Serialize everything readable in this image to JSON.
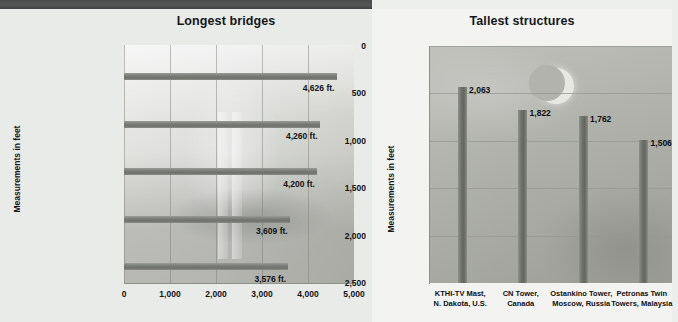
{
  "header": {
    "rule": "dark-rule"
  },
  "left": {
    "title": "Longest bridges",
    "axis_title": "Measurements in feet",
    "x_ticks": [
      "0",
      "1,000",
      "2,000",
      "3,000",
      "4,000",
      "5,000"
    ],
    "categories": [
      "Humber Estuary,|England",
      "Verrazano Narrows,|Brooklyn, NY, U.S.",
      "Golden Gate,|San Francisco, CA, U.S.",
      "Minami Bisan-Seto,|Japan",
      "Bosporus I,|Istanbul, Turkey"
    ],
    "value_labels": [
      "4,626 ft.",
      "4,260 ft.",
      "4,200 ft.",
      "3,609 ft.",
      "3,576 ft."
    ]
  },
  "right": {
    "title": "Tallest structures",
    "axis_title": "Measurements in feet",
    "y_ticks": [
      "2,500",
      "2,000",
      "1,500",
      "1,000",
      "500",
      "0"
    ],
    "categories": [
      "KTHI-TV Mast,|N. Dakota, U.S.",
      "CN Tower,|Canada",
      "Ostankino Tower,|Moscow, Russia",
      "Petronas Twin|Towers, Malaysia"
    ],
    "value_labels": [
      "2,063",
      "1,822",
      "1,762",
      "1,506"
    ]
  },
  "chart_data": [
    {
      "type": "bar",
      "orientation": "horizontal",
      "title": "Longest bridges",
      "xlabel": "",
      "ylabel": "Measurements in feet",
      "categories": [
        "Humber Estuary, England",
        "Verrazano Narrows, Brooklyn, NY, U.S.",
        "Golden Gate, San Francisco, CA, U.S.",
        "Minami Bisan-Seto, Japan",
        "Bosporus I, Istanbul, Turkey"
      ],
      "values": [
        4626,
        4260,
        4200,
        3609,
        3576
      ],
      "value_labels": [
        "4,626 ft.",
        "4,260 ft.",
        "4,200 ft.",
        "3,609 ft.",
        "3,576 ft."
      ],
      "xlim": [
        0,
        5000
      ],
      "xticks": [
        0,
        1000,
        2000,
        3000,
        4000,
        5000
      ],
      "grid": "vertical",
      "legend": "none",
      "units": "feet"
    },
    {
      "type": "bar",
      "orientation": "vertical",
      "title": "Tallest structures",
      "xlabel": "",
      "ylabel": "Measurements in feet",
      "categories": [
        "KTHI-TV Mast, N. Dakota, U.S.",
        "CN Tower, Canada",
        "Ostankino Tower, Moscow, Russia",
        "Petronas Twin Towers, Malaysia"
      ],
      "values": [
        2063,
        1822,
        1762,
        1506
      ],
      "value_labels": [
        "2,063",
        "1,822",
        "1,762",
        "1,506"
      ],
      "ylim": [
        0,
        2500
      ],
      "yticks": [
        0,
        500,
        1000,
        1500,
        2000,
        2500
      ],
      "grid": "horizontal",
      "legend": "none",
      "units": "feet"
    }
  ],
  "colors": {
    "page_background": "#edefed",
    "rule": "#4a4c4c",
    "bar": "#6f716c",
    "text": "#101214",
    "left_plot_bg": "#dcdedb",
    "right_plot_bg": "#b3b5ae"
  }
}
